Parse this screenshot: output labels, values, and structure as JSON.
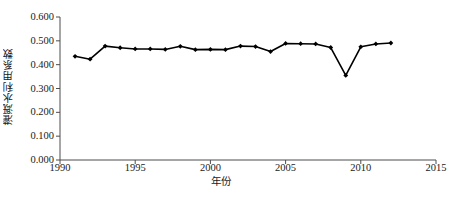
{
  "chart_data": {
    "type": "line",
    "title": "",
    "xlabel": "年份",
    "ylabel": "灌溉水利用系数",
    "xlim": [
      1990,
      2015
    ],
    "ylim": [
      0.0,
      0.6
    ],
    "xticks": [
      "1990",
      "1995",
      "2000",
      "2005",
      "2010",
      "2015"
    ],
    "xtick_values": [
      1990,
      1995,
      2000,
      2005,
      2010,
      2015
    ],
    "yticks": [
      "0.000",
      "0.100",
      "0.200",
      "0.300",
      "0.400",
      "0.500",
      "0.600"
    ],
    "ytick_values": [
      0.0,
      0.1,
      0.2,
      0.3,
      0.4,
      0.5,
      0.6
    ],
    "grid": false,
    "legend": null,
    "marker": "diamond",
    "line_color": "#000000",
    "marker_color": "#000000",
    "x": [
      1991,
      1992,
      1993,
      1994,
      1995,
      1996,
      1997,
      1998,
      1999,
      2000,
      2001,
      2002,
      2003,
      2004,
      2005,
      2006,
      2007,
      2008,
      2009,
      2010,
      2011,
      2012
    ],
    "values": [
      0.435,
      0.423,
      0.478,
      0.471,
      0.466,
      0.466,
      0.464,
      0.477,
      0.463,
      0.464,
      0.463,
      0.478,
      0.476,
      0.455,
      0.489,
      0.488,
      0.487,
      0.472,
      0.355,
      0.475,
      0.487,
      0.491
    ]
  },
  "caption": ""
}
